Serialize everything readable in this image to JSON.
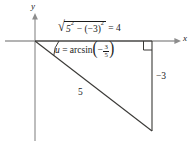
{
  "figure": {
    "axes": {
      "y_label": "y",
      "x_label": "x",
      "origin": [
        35,
        41
      ],
      "x_axis_from": [
        5,
        41
      ],
      "x_axis_to": [
        180,
        41
      ],
      "y_axis_from": [
        35,
        14
      ],
      "y_axis_to": [
        35,
        141
      ]
    },
    "labels": {
      "adjacent_expression": "√(5² − (−3)²) = 4",
      "adjacent_parts": {
        "radicand_base_1": "5",
        "radicand_exp_1": "2",
        "operator": "−",
        "radicand_base_2": "(−3)",
        "radicand_exp_2": "2",
        "equals": "=",
        "result": "4"
      },
      "angle_expression": "u = arcsin(−3/5)",
      "angle_parts": {
        "variable": "u",
        "equals": "=",
        "function": "arcsin",
        "arg_sign": "−",
        "arg_numerator": "3",
        "arg_denominator": "5"
      },
      "opposite_side": "−3",
      "hypotenuse": "5"
    },
    "geometry": {
      "vertices": {
        "origin": [
          35,
          41
        ],
        "right_angle_corner": [
          152,
          41
        ],
        "lower_right": [
          152,
          131
        ]
      },
      "right_angle_marker": true,
      "angle_arc_at_origin": true,
      "triangle_legs": [
        "adjacent = 4",
        "opposite = -3",
        "hypotenuse = 5"
      ]
    },
    "colors": {
      "stroke": "#33322f",
      "axis": "#8d8d8d",
      "text": "#1a1a1a",
      "background": "#ffffff"
    }
  }
}
